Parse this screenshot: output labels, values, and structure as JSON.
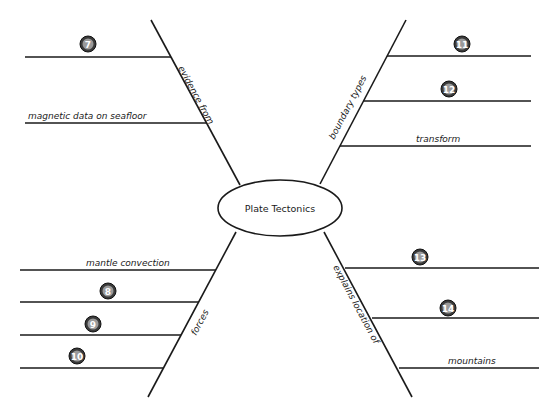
{
  "center": {
    "label": "Plate Tectonics"
  },
  "branches": {
    "top_left": {
      "label": "evidence from",
      "items": [
        {
          "badge": "7",
          "text": ""
        },
        {
          "badge": "",
          "text": "magnetic data on seafloor"
        }
      ]
    },
    "top_right": {
      "label": "boundary types",
      "items": [
        {
          "badge": "11",
          "text": ""
        },
        {
          "badge": "12",
          "text": ""
        },
        {
          "badge": "",
          "text": "transform"
        }
      ]
    },
    "bottom_left": {
      "label": "forces",
      "items": [
        {
          "badge": "",
          "text": "mantle convection"
        },
        {
          "badge": "8",
          "text": ""
        },
        {
          "badge": "9",
          "text": ""
        },
        {
          "badge": "10",
          "text": ""
        }
      ]
    },
    "bottom_right": {
      "label": "explains location of",
      "items": [
        {
          "badge": "13",
          "text": ""
        },
        {
          "badge": "14",
          "text": ""
        },
        {
          "badge": "",
          "text": "mountains"
        }
      ]
    }
  }
}
